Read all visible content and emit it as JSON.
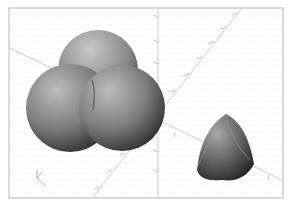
{
  "viewport": {
    "background": "#fafafa",
    "grid_color": "#ececec",
    "frame_color": "#b8b8b8",
    "axis_color": "#c4c4c4"
  },
  "objects": [
    {
      "name": "sphere-cluster",
      "type": "three overlapping spheres"
    },
    {
      "name": "reuleaux-tetrahedron",
      "type": "curved tetrahedron"
    }
  ],
  "axis_indicator": {
    "label": "axes-orientation"
  }
}
